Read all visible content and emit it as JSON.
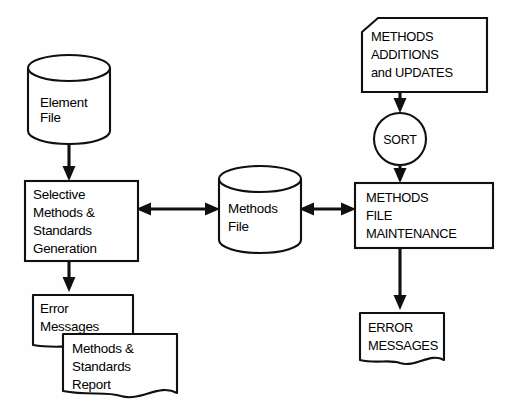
{
  "diagram": {
    "type": "flowchart",
    "background_color": "#fefefe",
    "line_color": "#101010",
    "fill_color": "#ffffff",
    "nodes": {
      "element_file": {
        "shape": "cylinder-database",
        "label_line1": "Element",
        "label_line2": "File"
      },
      "selective_generation": {
        "shape": "process-rectangle",
        "label_line1": "Selective",
        "label_line2": "Methods &",
        "label_line3": "Standards",
        "label_line4": "Generation"
      },
      "error_messages_left": {
        "shape": "document",
        "label_line1": "Error",
        "label_line2": "Messages"
      },
      "methods_standards_report": {
        "shape": "document",
        "label_line1": "Methods &",
        "label_line2": "Standards",
        "label_line3": "Report"
      },
      "methods_file": {
        "shape": "cylinder-database",
        "label_line1": "Methods",
        "label_line2": "File"
      },
      "methods_additions": {
        "shape": "punched-card",
        "label_line1": "METHODS",
        "label_line2": "ADDITIONS",
        "label_line3": "and UPDATES"
      },
      "sort": {
        "shape": "circle",
        "label_line1": "SORT"
      },
      "methods_file_maintenance": {
        "shape": "process-rectangle",
        "label_line1": "METHODS",
        "label_line2": "FILE",
        "label_line3": "MAINTENANCE"
      },
      "error_messages_right": {
        "shape": "document",
        "label_line1": "ERROR",
        "label_line2": "MESSAGES"
      }
    },
    "connectors": [
      {
        "id": "element-to-selective",
        "from": "element_file",
        "to": "selective_generation",
        "arrow": "single-down"
      },
      {
        "id": "selective-to-methodsfile",
        "from": "selective_generation",
        "to": "methods_file",
        "arrow": "double-horizontal"
      },
      {
        "id": "methodsfile-to-maintenance",
        "from": "methods_file",
        "to": "methods_file_maintenance",
        "arrow": "double-horizontal"
      },
      {
        "id": "selective-to-error",
        "from": "selective_generation",
        "to": "error_messages_left",
        "arrow": "single-down"
      },
      {
        "id": "additions-to-sort",
        "from": "methods_additions",
        "to": "sort",
        "arrow": "single-down"
      },
      {
        "id": "sort-to-maintenance",
        "from": "sort",
        "to": "methods_file_maintenance",
        "arrow": "single-down"
      },
      {
        "id": "maintenance-to-error",
        "from": "methods_file_maintenance",
        "to": "error_messages_right",
        "arrow": "single-down"
      }
    ]
  }
}
